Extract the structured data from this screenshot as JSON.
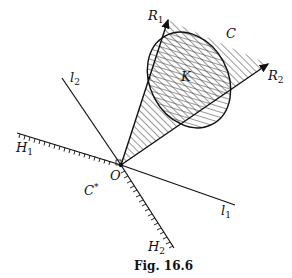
{
  "figure": {
    "caption": "Fig. 16.6",
    "labels": {
      "R1": {
        "main": "R",
        "sub": "1"
      },
      "R2": {
        "main": "R",
        "sub": "2"
      },
      "C": {
        "main": "C"
      },
      "K": {
        "main": "K"
      },
      "l1": {
        "main": "l",
        "sub": "1"
      },
      "l2": {
        "main": "l",
        "sub": "2"
      },
      "H1": {
        "main": "H",
        "sub": "1"
      },
      "H2": {
        "main": "H",
        "sub": "2"
      },
      "O": {
        "main": "O"
      },
      "Cstar": {
        "main": "C",
        "sup": "*"
      }
    },
    "colors": {
      "ink": "#1a1a1a",
      "background": "#ffffff"
    }
  }
}
